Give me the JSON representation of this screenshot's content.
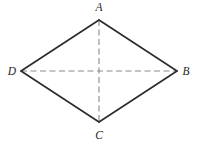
{
  "figure": {
    "name": "rhombus-with-diagonals",
    "canvas": {
      "width": 198,
      "height": 146
    },
    "background_color": "#ffffff",
    "stroke_color": "#2b2b2b",
    "dash_color": "#8a8a8a",
    "label_color": "#262626",
    "edge_stroke_width": 1.6,
    "diagonal_stroke_width": 1.1,
    "dash_pattern": "6,3.5",
    "vertices": [
      {
        "id": "A",
        "label": "A",
        "x": 99,
        "y": 20,
        "label_x": 99,
        "label_y": 11,
        "label_anchor": "middle",
        "position": "top"
      },
      {
        "id": "B",
        "label": "B",
        "x": 177,
        "y": 71,
        "label_x": 186,
        "label_y": 75,
        "label_anchor": "middle",
        "position": "right"
      },
      {
        "id": "C",
        "label": "C",
        "x": 99,
        "y": 122,
        "label_x": 99,
        "label_y": 139,
        "label_anchor": "middle",
        "position": "bottom"
      },
      {
        "id": "D",
        "label": "D",
        "x": 21,
        "y": 71,
        "label_x": 12,
        "label_y": 75,
        "label_anchor": "middle",
        "position": "left"
      }
    ],
    "edges": [
      {
        "id": "AB",
        "from": "A",
        "to": "B",
        "style": "solid"
      },
      {
        "id": "BC",
        "from": "B",
        "to": "C",
        "style": "solid"
      },
      {
        "id": "CD",
        "from": "C",
        "to": "D",
        "style": "solid"
      },
      {
        "id": "DA",
        "from": "D",
        "to": "A",
        "style": "solid"
      }
    ],
    "diagonals": [
      {
        "id": "AC",
        "from": "A",
        "to": "C",
        "style": "dashed",
        "orientation": "vertical"
      },
      {
        "id": "DB",
        "from": "D",
        "to": "B",
        "style": "dashed",
        "orientation": "horizontal"
      }
    ],
    "outline_points": "99,20 177,71 99,122 21,71"
  }
}
